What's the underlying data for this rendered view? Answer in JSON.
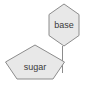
{
  "canvas": {
    "width": 87,
    "height": 90,
    "background_color": "#ffffff"
  },
  "style": {
    "node_fill": "#e8e8e8",
    "node_stroke": "#8c8c8c",
    "edge_stroke": "#8c8c8c",
    "label_color": "#3a3a3a",
    "label_font_size": "9px"
  },
  "diagram": {
    "type": "node-link-diagram",
    "nodes": [
      {
        "id": "base",
        "label": "base",
        "shape": "hexagon",
        "points": "64,4 79,14.5 79,35.5 64,46 49,35.5 49,14.5",
        "label_x": 64,
        "label_y": 25.5
      },
      {
        "id": "sugar",
        "label": "sugar",
        "shape": "pentagon",
        "points": "35,45 64.5,62 53,79 17,79 5.5,62",
        "label_x": 35,
        "label_y": 68
      }
    ],
    "edges": [
      {
        "id": "base-to-sugar",
        "from": "base",
        "to": "sugar",
        "path": "M 62 45.5 L 62 72.5"
      }
    ]
  }
}
